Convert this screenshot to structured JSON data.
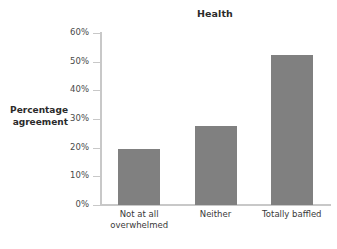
{
  "chart_data": {
    "type": "bar",
    "title": "Health",
    "xlabel": "",
    "ylabel": "Percentage agreement",
    "ylabel_lines": [
      "Percentage",
      "agreement"
    ],
    "categories": [
      "Not at all overwhelmed",
      "Neither",
      "Totally baffled"
    ],
    "category_lines": [
      [
        "Not at all",
        "overwhelmed"
      ],
      [
        "Neither"
      ],
      [
        "Totally baffled"
      ]
    ],
    "values": [
      19.7,
      27.5,
      52.5
    ],
    "ylim": [
      0,
      60
    ],
    "ytick_values": [
      0,
      10,
      20,
      30,
      40,
      50,
      60
    ],
    "ytick_labels": [
      "0%",
      "10%",
      "20%",
      "30%",
      "40%",
      "50%",
      "60%"
    ],
    "grid": false,
    "legend": false,
    "bar_color": "#808080",
    "axis_color": "#c8c8c8",
    "background_color": "#ffffff"
  }
}
